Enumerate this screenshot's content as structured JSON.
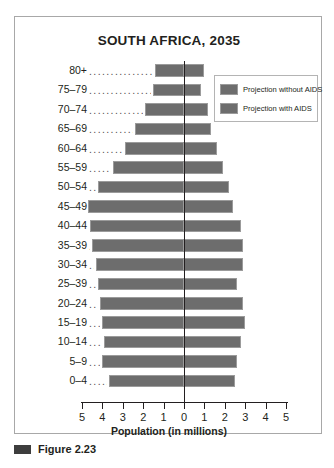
{
  "figure": {
    "caption": "Figure 2.23",
    "bullet_icon": "filled-square-icon"
  },
  "chart_data": {
    "type": "bar",
    "subtype": "population-pyramid",
    "title": "SOUTH AFRICA, 2035",
    "xlabel": "Population (in millions)",
    "ylabel": "",
    "grid": false,
    "legend_position": "top-right",
    "xlim": [
      -5,
      5
    ],
    "x_tick_labels": [
      "5",
      "4",
      "3",
      "2",
      "1",
      "0",
      "1",
      "2",
      "3",
      "4",
      "5"
    ],
    "x_tick_values": [
      -5,
      -4,
      -3,
      -2,
      -1,
      0,
      1,
      2,
      3,
      4,
      5
    ],
    "categories": [
      "80+",
      "75–79",
      "70–74",
      "65–69",
      "60–64",
      "55–59",
      "50–54",
      "45–49",
      "40–44",
      "35–39",
      "30–34",
      "25–39",
      "20–24",
      "15–19",
      "10–14",
      "5–9",
      "0–4"
    ],
    "series": [
      {
        "name": "Projection without AIDS",
        "side": "left",
        "values": [
          1.4,
          1.5,
          1.9,
          2.4,
          2.9,
          3.5,
          4.2,
          4.7,
          4.6,
          4.5,
          4.3,
          4.2,
          4.1,
          4.0,
          3.9,
          4.0,
          3.7
        ]
      },
      {
        "name": "Projection with AIDS",
        "side": "right",
        "values": [
          1.0,
          0.85,
          1.2,
          1.3,
          1.6,
          1.9,
          2.2,
          2.4,
          2.8,
          2.9,
          2.9,
          2.6,
          2.9,
          3.0,
          2.8,
          2.6,
          2.5
        ]
      }
    ],
    "colors": {
      "bar": "#6d6d6d",
      "bar_border": "#9b9b9b",
      "axis": "#231f20",
      "frame": "#a8a8a8"
    }
  },
  "legend": {
    "items": [
      {
        "label": "Projection without AIDS",
        "swatch_color": "#6d6d6d"
      },
      {
        "label": "Projection with AIDS",
        "swatch_color": "#6d6d6d"
      }
    ]
  }
}
